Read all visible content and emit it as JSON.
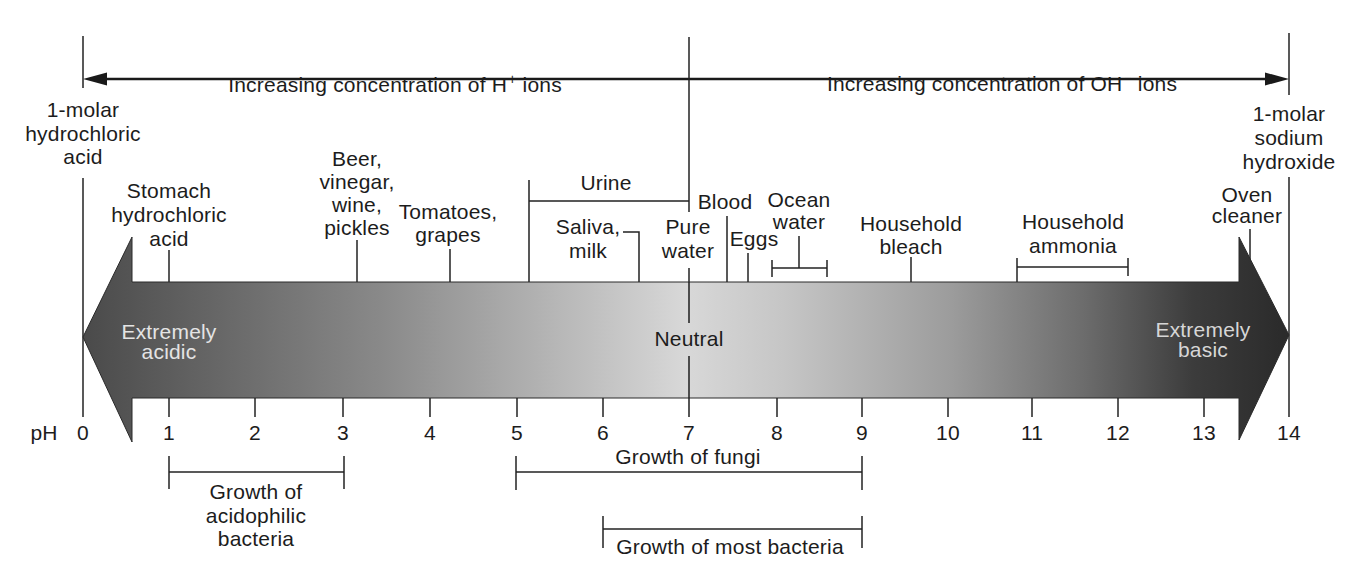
{
  "top_axis": {
    "acid_side": {
      "pre": "Increasing concentration of H",
      "sup": "+",
      "post": " ions"
    },
    "base_side": {
      "pre": "Increasing concentration of OH",
      "sup": "−",
      "post": " ions"
    }
  },
  "endpoints": {
    "left": {
      "label": "1-molar\nhydrochloric\nacid",
      "ph": 0
    },
    "right": {
      "label": "1-molar\nsodium\nhydroxide",
      "ph": 14
    }
  },
  "substances": [
    {
      "label": "Stomach\nhydrochloric\nacid",
      "ph": 1.0
    },
    {
      "label": "Beer,\nvinegar,\nwine,\npickles",
      "ph": 3.2
    },
    {
      "label": "Tomatoes,\ngrapes",
      "ph": 4.2
    },
    {
      "label": "Urine",
      "ph_range": [
        5.2,
        7.0
      ]
    },
    {
      "label": "Saliva,\nmilk",
      "ph": 6.4
    },
    {
      "label": "Pure\nwater",
      "ph": 7.0
    },
    {
      "label": "Blood",
      "ph": 7.4
    },
    {
      "label": "Eggs",
      "ph": 7.7
    },
    {
      "label": "Ocean\nwater",
      "ph_range": [
        8.0,
        8.6
      ]
    },
    {
      "label": "Household\nbleach",
      "ph": 9.6
    },
    {
      "label": "Household\nammonia",
      "ph_range": [
        10.8,
        12.1
      ]
    },
    {
      "label": "Oven\ncleaner",
      "ph": 13.5
    }
  ],
  "band": {
    "left_label": "Extremely\nacidic",
    "center_label": "Neutral",
    "right_label": "Extremely\nbasic",
    "colors": {
      "acidic_end": "#4a4a4a",
      "neutral": "#d8d8d8",
      "basic_end": "#2a2a2a"
    }
  },
  "scale": {
    "label": "pH",
    "ticks": [
      "0",
      "1",
      "2",
      "3",
      "4",
      "5",
      "6",
      "7",
      "8",
      "9",
      "10",
      "11",
      "12",
      "13",
      "14"
    ]
  },
  "growth_ranges": [
    {
      "label": "Growth of\nacidophilic\nbacteria",
      "ph_range": [
        1,
        3
      ]
    },
    {
      "label": "Growth of fungi",
      "ph_range": [
        5,
        9
      ]
    },
    {
      "label": "Growth of most bacteria",
      "ph_range": [
        6,
        9
      ]
    }
  ]
}
